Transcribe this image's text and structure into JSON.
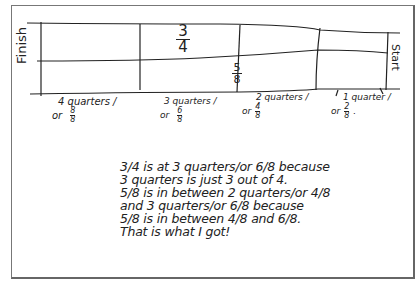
{
  "diagram": {
    "ends": {
      "left": "Finish",
      "right": "Start"
    },
    "marks_in_bar": [
      {
        "num": "3",
        "den": "4"
      },
      {
        "num": "5",
        "den": "8"
      }
    ],
    "tick_labels": [
      {
        "line1": "4 quarters /",
        "or": "or",
        "num": "8",
        "den": "8"
      },
      {
        "line1": "3 quarters /",
        "or": "or",
        "num": "6",
        "den": "8"
      },
      {
        "line1": "2 quarters /",
        "or": "or",
        "num": "4",
        "den": "8"
      },
      {
        "line1": "1 quarter /",
        "or": "or",
        "num": "2",
        "den": "8",
        "suffix": "."
      }
    ],
    "explanation": [
      "3/4 is at 3 quarters/or 6/8 because",
      "3 quarters is just 3 out of 4.",
      "5/8 is in between 2 quarters/or 4/8",
      "and 3 quarters/or 6/8 because",
      "5/8 is in between 4/8 and 6/8.",
      "That is what I got!"
    ]
  }
}
